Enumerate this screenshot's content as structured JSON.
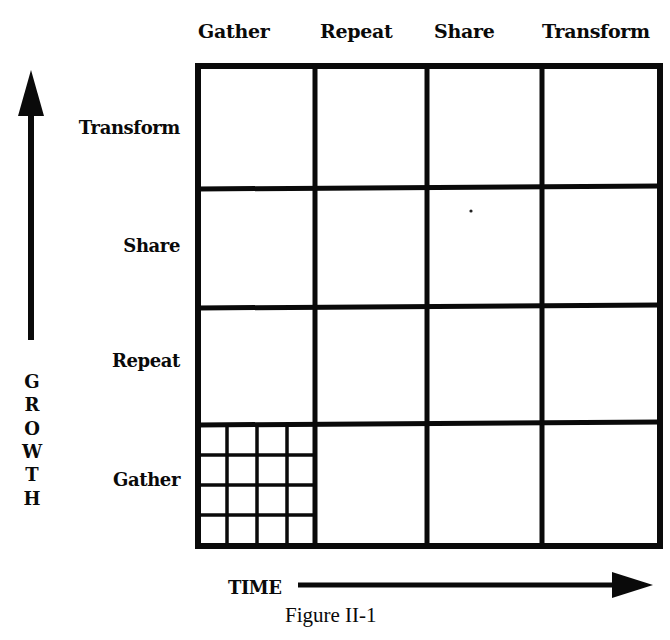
{
  "figure": {
    "caption": "Figure II-1",
    "x_axis": {
      "label": "TIME",
      "direction": "right"
    },
    "y_axis": {
      "label_letters": [
        "G",
        "R",
        "O",
        "W",
        "T",
        "H"
      ],
      "label": "GROWTH",
      "direction": "up"
    },
    "columns": [
      "Gather",
      "Repeat",
      "Share",
      "Transform"
    ],
    "rows_top_to_bottom": [
      "Transform",
      "Share",
      "Repeat",
      "Gather"
    ],
    "subdivided_cell": {
      "row": "Gather",
      "column": "Gather",
      "subgrid": "4x4"
    },
    "colors": {
      "ink": "#0a0a0a",
      "background": "#ffffff"
    }
  }
}
